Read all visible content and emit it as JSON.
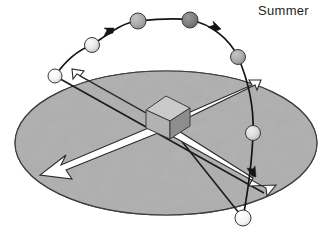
{
  "figure": {
    "kind": "astronomy-diagram",
    "title_label": "Summer",
    "description_name": "summer-sun-path-over-horizon-disc"
  },
  "labels": {
    "summer": "Summer"
  },
  "colors": {
    "background": "#ffffff",
    "disc_fill": "#a9a9a9",
    "disc_fill_light": "#bdbdbd",
    "disc_fill_dark": "#9a9a9a",
    "disc_outline": "#3a3a3a",
    "speckle": "#6e6e6e",
    "orbit_line": "#1a1a1a",
    "arrow_fill": "#ffffff",
    "arrow_outline": "#2b2b2b",
    "gnomon_top": "#c9c9c9",
    "gnomon_left": "#b0b0b0",
    "gnomon_right": "#8f8f8f",
    "text": "#231f20"
  },
  "disc": {
    "name": "horizon-disc",
    "cx": 166,
    "cy": 143,
    "rx": 151,
    "ry": 72
  },
  "gnomon": {
    "name": "central-gnomon-pillar",
    "cx": 166,
    "cy": 117
  },
  "sun_path": {
    "name": "sun-orbit-arc",
    "direction_arrows": 3,
    "points": [
      {
        "x": 55,
        "y": 76
      },
      {
        "x": 92,
        "y": 45
      },
      {
        "x": 138,
        "y": 21
      },
      {
        "x": 190,
        "y": 20
      },
      {
        "x": 238,
        "y": 57
      },
      {
        "x": 253,
        "y": 133
      },
      {
        "x": 243,
        "y": 218
      }
    ]
  },
  "sun_positions": [
    {
      "id": "sun-rise",
      "x": 55,
      "y": 76,
      "r": 7.0,
      "shade": "#f2f2f2",
      "order": 1
    },
    {
      "id": "sun-morning",
      "x": 92,
      "y": 45,
      "r": 7.5,
      "shade": "#e2e2e2",
      "order": 2
    },
    {
      "id": "sun-midmorning",
      "x": 138,
      "y": 21,
      "r": 8.0,
      "shade": "#a8a8a8",
      "order": 3
    },
    {
      "id": "sun-noon",
      "x": 190,
      "y": 20,
      "r": 8.0,
      "shade": "#7d7d7d",
      "order": 4
    },
    {
      "id": "sun-afternoon",
      "x": 238,
      "y": 57,
      "r": 7.5,
      "shade": "#a8a8a8",
      "order": 5
    },
    {
      "id": "sun-evening",
      "x": 253,
      "y": 133,
      "r": 7.5,
      "shade": "#d8d8d8",
      "order": 6
    },
    {
      "id": "sun-set",
      "x": 243,
      "y": 218,
      "r": 8.0,
      "shade": "#f4f4f4",
      "order": 7
    }
  ],
  "shadow_arrows": [
    {
      "id": "shadow-arrow-northwest",
      "tip_x": 64,
      "tip_y": 78,
      "note": "short arrow toward upper-left rim"
    },
    {
      "id": "shadow-arrow-northeast",
      "tip_x": 258,
      "tip_y": 85,
      "note": "arrow toward upper-right rim"
    },
    {
      "id": "shadow-arrow-southwest",
      "tip_x": 40,
      "tip_y": 175,
      "note": "long arrow toward lower-left rim"
    },
    {
      "id": "shadow-arrow-southeast",
      "tip_x": 262,
      "tip_y": 192,
      "note": "long arrow toward lower-right rim"
    }
  ],
  "ray_lines": [
    {
      "id": "ray-line-from-sunrise",
      "from": "sun-rise",
      "to": "shadow-arrow-southeast"
    },
    {
      "id": "ray-line-from-sunset",
      "from": "sun-set",
      "to": "gnomon"
    }
  ]
}
